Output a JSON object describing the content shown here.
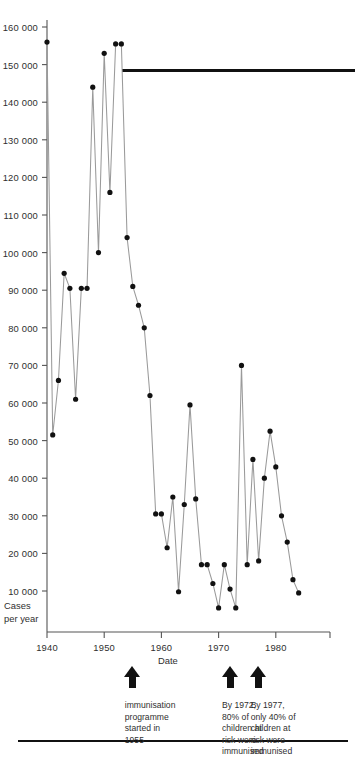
{
  "chart_data": {
    "type": "line",
    "title": "",
    "xlabel": "Date",
    "ylabel": "Cases\nper year",
    "xlim": [
      1939,
      1985
    ],
    "ylim": [
      0,
      160000
    ],
    "grid": false,
    "legend": null,
    "marker": "filled-circle",
    "xticks": [
      1940,
      1950,
      1960,
      1970,
      1980
    ],
    "xtick_labels": [
      "1940",
      "1950",
      "1960",
      "1970",
      "1980"
    ],
    "yticks": [
      10000,
      20000,
      30000,
      40000,
      50000,
      60000,
      70000,
      80000,
      90000,
      100000,
      110000,
      120000,
      130000,
      140000,
      150000,
      160000
    ],
    "ytick_labels": [
      "10 000",
      "20 000",
      "30 000",
      "40 000",
      "50 000",
      "60 000",
      "70 000",
      "80 000",
      "90 000",
      "100 000",
      "110 000",
      "120 000",
      "130 000",
      "140 000",
      "150 000",
      "160 000"
    ],
    "x": [
      1940,
      1941,
      1942,
      1943,
      1944,
      1945,
      1946,
      1947,
      1948,
      1949,
      1950,
      1951,
      1952,
      1953,
      1954,
      1955,
      1956,
      1957,
      1958,
      1959,
      1960,
      1961,
      1962,
      1963,
      1964,
      1965,
      1966,
      1967,
      1968,
      1969,
      1970,
      1971,
      1972,
      1973,
      1974,
      1975,
      1976,
      1977,
      1978,
      1979,
      1980,
      1981,
      1982,
      1983,
      1984
    ],
    "values": [
      156000,
      51500,
      66000,
      94500,
      90500,
      61000,
      90500,
      90500,
      144000,
      100000,
      153000,
      116000,
      155500,
      155500,
      104000,
      91000,
      86000,
      80000,
      62000,
      30500,
      30500,
      21500,
      35000,
      9800,
      33000,
      59500,
      34500,
      17000,
      17000,
      12000,
      5500,
      17000,
      10500,
      5500,
      70000,
      17000,
      45000,
      18000,
      40000,
      52500,
      43000,
      30000,
      23000,
      13000,
      9500
    ],
    "series_name": "Cases per year",
    "annotations": [
      {
        "id": "immunisation-programme",
        "year": 1955,
        "text": "immunisation\nprogramme\nstarted in\n1955",
        "arrow": "up"
      },
      {
        "id": "by-1972",
        "year": 1972,
        "text": "By 1972,\n80% of\nchildren at\nrisk were\nimmunised",
        "arrow": "up"
      },
      {
        "id": "by-1977",
        "year": 1977,
        "text": "By 1977,\nonly 40% of\nchildren at\nrisk were\nimmunised",
        "arrow": "up"
      }
    ],
    "colors": {
      "line": "#9a9a9a",
      "marker": "#111111",
      "axis": "#555555",
      "text": "#2f2f2f",
      "rule": "#111111"
    }
  }
}
